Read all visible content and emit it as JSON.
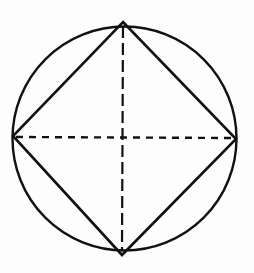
{
  "diagram": {
    "type": "geometric-figure",
    "stroke_color": "#111111",
    "background_color": "#fdfdfd",
    "circle": {
      "cx": 124.5,
      "cy": 138.5,
      "r": 112,
      "stroke_width": 2.4
    },
    "square": {
      "vertices": {
        "top": [
          123,
          22
        ],
        "right": [
          236,
          139
        ],
        "bottom": [
          122,
          255
        ],
        "left": [
          13,
          136
        ]
      },
      "stroke_width": 2.6
    },
    "diagonals": {
      "horizontal": {
        "x1": 16,
        "y1": 137,
        "x2": 233,
        "y2": 138,
        "dash": "7 6",
        "stroke_width": 2.4
      },
      "vertical": {
        "x1": 123,
        "y1": 26,
        "x2": 122,
        "y2": 250,
        "dash": "12 5",
        "stroke_width": 2.2
      }
    }
  }
}
